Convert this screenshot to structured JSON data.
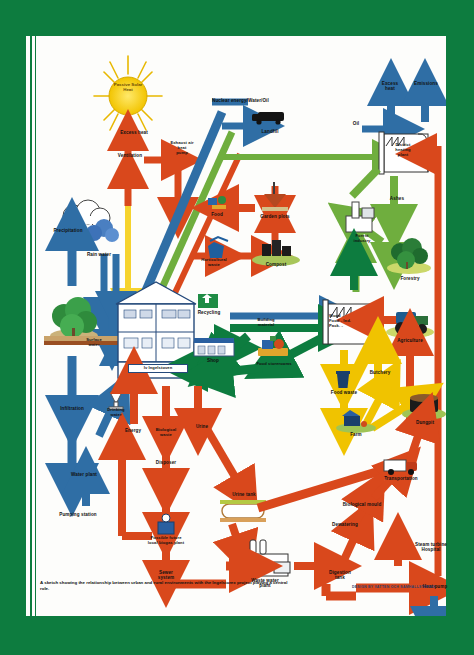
{
  "page": {
    "background_color": "#0d7c3f",
    "sheet_color": "#fdfdfb",
    "caption": "A sketch showing the relationship between urban and rural environments with the Ingelstorex project playing a central role.",
    "credit": "DESIGN BY VATTEN OCH SAMHALLSTEKNIK"
  },
  "palette": {
    "green": "#0d7c3f",
    "light_green": "#6fae3e",
    "blue": "#2f6ea5",
    "dark_blue": "#1f4f7d",
    "red": "#d9481c",
    "orange_red": "#e05a22",
    "yellow": "#f0c300",
    "sun_yellow": "#f6d32d",
    "brown": "#8a5a2b"
  },
  "diagram": {
    "type": "flow-diagram",
    "nodes": [
      {
        "id": "passive-solar-heat",
        "label": "Passive\nSolar\nHeat",
        "x": 102,
        "y": 52,
        "kind": "sun"
      },
      {
        "id": "excess-heat-house",
        "label": "Excess heat",
        "x": 108,
        "y": 97,
        "kind": "label"
      },
      {
        "id": "ventilation",
        "label": "Ventilation",
        "x": 104,
        "y": 120,
        "kind": "label"
      },
      {
        "id": "exhaust-air-heat-pump",
        "label": "Exhaust air\nheat\npump",
        "x": 156,
        "y": 112,
        "kind": "label"
      },
      {
        "id": "nuclear-energy-water-oil",
        "label": "Nuclear energy/Water/Oil",
        "x": 248,
        "y": 71,
        "kind": "label"
      },
      {
        "id": "landfill",
        "label": "Landfill",
        "x": 244,
        "y": 95,
        "kind": "icon-truck"
      },
      {
        "id": "excess-heat-plant",
        "label": "Excess\nheat",
        "x": 364,
        "y": 52,
        "kind": "label"
      },
      {
        "id": "emissions",
        "label": "Emissions",
        "x": 399,
        "y": 52,
        "kind": "label"
      },
      {
        "id": "oil",
        "label": "Oil",
        "x": 330,
        "y": 89,
        "kind": "label"
      },
      {
        "id": "district-heating-plant",
        "label": "District\nheating\nplant",
        "x": 374,
        "y": 108,
        "kind": "icon-factory"
      },
      {
        "id": "ashes",
        "label": "Ashes",
        "x": 375,
        "y": 163,
        "kind": "label"
      },
      {
        "id": "forest-industry",
        "label": "Forest\nindustry",
        "x": 336,
        "y": 208,
        "kind": "icon-mill"
      },
      {
        "id": "forestry",
        "label": "Forestry",
        "x": 383,
        "y": 227,
        "kind": "icon-trees"
      },
      {
        "id": "food",
        "label": "Food",
        "x": 191,
        "y": 180,
        "kind": "icon-food"
      },
      {
        "id": "garden-plots",
        "label": "Garden plots",
        "x": 249,
        "y": 180,
        "kind": "icon-plot"
      },
      {
        "id": "horticultural-waste",
        "label": "Horticultural\nwaste",
        "x": 188,
        "y": 228,
        "kind": "icon-bin"
      },
      {
        "id": "compost",
        "label": "Compost",
        "x": 248,
        "y": 228,
        "kind": "icon-compost"
      },
      {
        "id": "precipitation",
        "label": "Precipitation",
        "x": 38,
        "y": 193,
        "kind": "icon-cloud"
      },
      {
        "id": "rain-water",
        "label": "Rain water",
        "x": 71,
        "y": 219,
        "kind": "label"
      },
      {
        "id": "recycling",
        "label": "Recycling",
        "x": 182,
        "y": 275,
        "kind": "icon-recycle"
      },
      {
        "id": "building-material",
        "label": "Building\nmaterial",
        "x": 238,
        "y": 290,
        "kind": "label"
      },
      {
        "id": "wood-food-ind-pack",
        "label": "Wood -\nFood -  Ind.\nPack. -",
        "x": 318,
        "y": 292,
        "kind": "icon-factory2"
      },
      {
        "id": "shop",
        "label": "Shop",
        "x": 186,
        "y": 321,
        "kind": "icon-shop"
      },
      {
        "id": "food-storerooms",
        "label": "Food storerooms",
        "x": 248,
        "y": 326,
        "kind": "icon-store"
      },
      {
        "id": "agriculture",
        "label": "Agriculture",
        "x": 382,
        "y": 305,
        "kind": "icon-tractor"
      },
      {
        "id": "food-waste",
        "label": "Food waste",
        "x": 315,
        "y": 345,
        "kind": "icon-bin2"
      },
      {
        "id": "butchery",
        "label": "Butchery",
        "x": 354,
        "y": 337,
        "kind": "label"
      },
      {
        "id": "dungpit",
        "label": "Dungpit",
        "x": 399,
        "y": 374,
        "kind": "icon-dung"
      },
      {
        "id": "farm",
        "label": "Farm",
        "x": 330,
        "y": 396,
        "kind": "icon-farm"
      },
      {
        "id": "surface-water",
        "label": "Surface\nwater",
        "x": 66,
        "y": 307,
        "kind": "label"
      },
      {
        "id": "house",
        "label": "Iv Ingelstoven",
        "x": 120,
        "y": 285,
        "kind": "icon-house"
      },
      {
        "id": "infiltration",
        "label": "Infiltration",
        "x": 42,
        "y": 372,
        "kind": "label"
      },
      {
        "id": "drinking-water",
        "label": "Drinking\nwater",
        "x": 89,
        "y": 369,
        "kind": "icon-glass"
      },
      {
        "id": "water-plant",
        "label": "Water plant",
        "x": 58,
        "y": 411,
        "kind": "label"
      },
      {
        "id": "pumping-station",
        "label": "Pumping station",
        "x": 52,
        "y": 444,
        "kind": "label"
      },
      {
        "id": "energy",
        "label": "Energy",
        "x": 105,
        "y": 407,
        "kind": "label"
      },
      {
        "id": "biological-waste",
        "label": "Biological\nwaste",
        "x": 139,
        "y": 405,
        "kind": "label"
      },
      {
        "id": "urine",
        "label": "Urine",
        "x": 184,
        "y": 394,
        "kind": "label"
      },
      {
        "id": "disposer",
        "label": "Disposer",
        "x": 137,
        "y": 446,
        "kind": "label"
      },
      {
        "id": "possible-future-local-biogas-plant",
        "label": "Possible future\nlocal biogas plant",
        "x": 137,
        "y": 500,
        "kind": "icon-biogas"
      },
      {
        "id": "sewer-system",
        "label": "Sewer\nsystem",
        "x": 137,
        "y": 540,
        "kind": "label"
      },
      {
        "id": "urine-tank",
        "label": "Urine tank",
        "x": 217,
        "y": 463,
        "kind": "icon-tank"
      },
      {
        "id": "waste-water-plant",
        "label": "Waste water\nplant",
        "x": 238,
        "y": 543,
        "kind": "icon-wwplant"
      },
      {
        "id": "digestion-tank",
        "label": "Digestion\ntank",
        "x": 312,
        "y": 540,
        "kind": "label"
      },
      {
        "id": "dewatering",
        "label": "Dewatering",
        "x": 318,
        "y": 498,
        "kind": "label"
      },
      {
        "id": "biological-mould",
        "label": "Biological mould",
        "x": 337,
        "y": 479,
        "kind": "label"
      },
      {
        "id": "transportation",
        "label": "Transportation",
        "x": 375,
        "y": 444,
        "kind": "icon-truck2"
      },
      {
        "id": "steam-turbine-hospital",
        "label": "Steam turbine\nHospital",
        "x": 406,
        "y": 517,
        "kind": "label"
      },
      {
        "id": "heat-pump",
        "label": "Heat pump",
        "x": 410,
        "y": 551,
        "kind": "label"
      }
    ],
    "flow_colors": {
      "energy_heat": "#d9481c",
      "water": "#2f6ea5",
      "material_green": "#0d7c3f",
      "biomass": "#6fae3e",
      "food_yellow": "#f0c300",
      "solar": "#f6d32d"
    }
  }
}
